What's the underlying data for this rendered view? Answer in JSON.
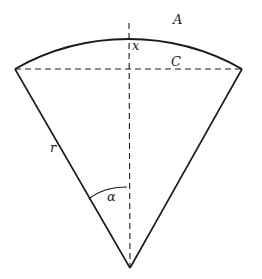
{
  "diagram": {
    "type": "circular-sector-geometry",
    "stroke_color": "#1a1a1a",
    "background": "#ffffff",
    "points": {
      "left_vertex": [
        15,
        69
      ],
      "right_vertex": [
        242,
        69
      ],
      "apex": [
        130,
        268
      ],
      "arc_top": [
        129,
        22
      ],
      "chord_midpoint": [
        129,
        69
      ]
    },
    "labels": {
      "arc": "A",
      "sagitta": "x",
      "chord": "C",
      "radius": "r",
      "angle": "α"
    },
    "elements": [
      {
        "name": "arc-A",
        "style": "solid",
        "description": "circular arc of sector"
      },
      {
        "name": "radius-left",
        "style": "solid",
        "description": "left radius r"
      },
      {
        "name": "radius-right",
        "style": "solid",
        "description": "right radius"
      },
      {
        "name": "chord-C",
        "style": "dashed",
        "description": "chord C across sector"
      },
      {
        "name": "bisector",
        "style": "dashed",
        "description": "vertical bisector from apex to arc top"
      },
      {
        "name": "angle-alpha-arc",
        "style": "solid",
        "description": "half-angle alpha marker"
      }
    ]
  }
}
